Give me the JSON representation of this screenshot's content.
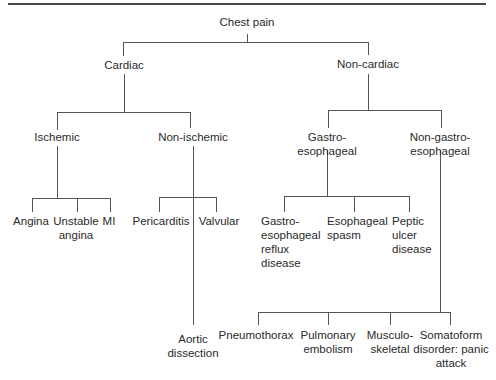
{
  "diagram": {
    "title": "Chest pain",
    "nodes": {
      "root": {
        "lines": [
          "Chest pain"
        ]
      },
      "cardiac": {
        "lines": [
          "Cardiac"
        ]
      },
      "non_cardiac": {
        "lines": [
          "Non-cardiac"
        ]
      },
      "ischemic": {
        "lines": [
          "Ischemic"
        ]
      },
      "non_ischemic": {
        "lines": [
          "Non-ischemic"
        ]
      },
      "gastro": {
        "lines": [
          "Gastro-",
          "esophageal"
        ]
      },
      "non_gastro": {
        "lines": [
          "Non-gastro-",
          "esophageal"
        ]
      },
      "angina": {
        "lines": [
          "Angina"
        ]
      },
      "unstable_angina": {
        "lines": [
          "Unstable",
          "angina"
        ]
      },
      "mi": {
        "lines": [
          "MI"
        ]
      },
      "pericarditis": {
        "lines": [
          "Pericarditis"
        ]
      },
      "valvular": {
        "lines": [
          "Valvular"
        ]
      },
      "aortic_dissection": {
        "lines": [
          "Aortic",
          "dissection"
        ]
      },
      "gerd": {
        "lines": [
          "Gastro-",
          "esophageal",
          "reflux",
          "disease"
        ]
      },
      "esophageal_spasm": {
        "lines": [
          "Esophageal",
          "spasm"
        ]
      },
      "peptic_ulcer": {
        "lines": [
          "Peptic",
          "ulcer",
          "disease"
        ]
      },
      "pneumothorax": {
        "lines": [
          "Pneumothorax"
        ]
      },
      "pulmonary_embolism": {
        "lines": [
          "Pulmonary",
          "embolism"
        ]
      },
      "musculoskeletal": {
        "lines": [
          "Musculo-",
          "skeletal"
        ]
      },
      "somatoform": {
        "lines": [
          "Somatoform",
          "disorder: panic",
          "attack"
        ]
      }
    },
    "edges": [
      [
        "root",
        "cardiac"
      ],
      [
        "root",
        "non_cardiac"
      ],
      [
        "cardiac",
        "ischemic"
      ],
      [
        "cardiac",
        "non_ischemic"
      ],
      [
        "ischemic",
        "angina"
      ],
      [
        "ischemic",
        "unstable_angina"
      ],
      [
        "ischemic",
        "mi"
      ],
      [
        "non_ischemic",
        "pericarditis"
      ],
      [
        "non_ischemic",
        "valvular"
      ],
      [
        "non_ischemic",
        "aortic_dissection"
      ],
      [
        "non_cardiac",
        "gastro"
      ],
      [
        "non_cardiac",
        "non_gastro"
      ],
      [
        "gastro",
        "gerd"
      ],
      [
        "gastro",
        "esophageal_spasm"
      ],
      [
        "gastro",
        "peptic_ulcer"
      ],
      [
        "non_gastro",
        "pneumothorax"
      ],
      [
        "non_gastro",
        "pulmonary_embolism"
      ],
      [
        "non_gastro",
        "musculoskeletal"
      ],
      [
        "non_gastro",
        "somatoform"
      ]
    ],
    "colors": {
      "line": "#555555",
      "text": "#2a2a2a",
      "rule": "#4a4a4a"
    }
  }
}
